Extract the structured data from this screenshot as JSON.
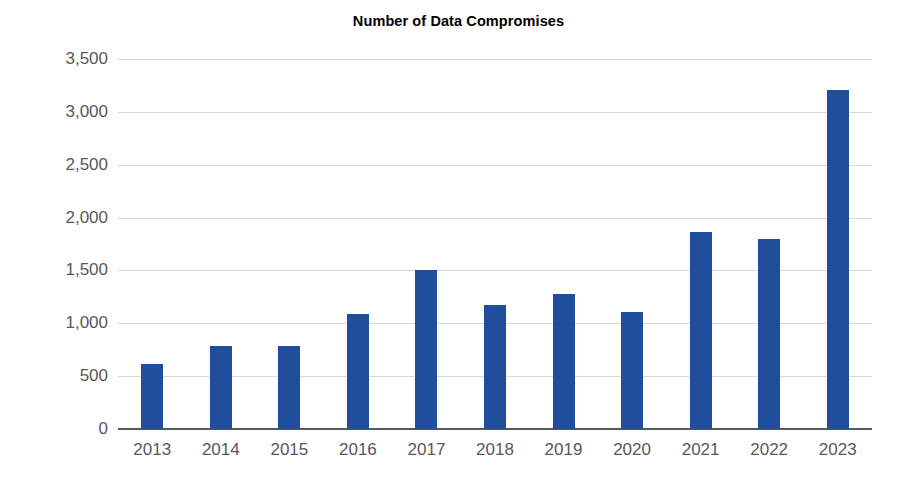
{
  "chart_data": {
    "type": "bar",
    "title": "Number of Data Compromises",
    "xlabel": "",
    "ylabel": "",
    "categories": [
      "2013",
      "2014",
      "2015",
      "2016",
      "2017",
      "2018",
      "2019",
      "2020",
      "2021",
      "2022",
      "2023"
    ],
    "values": [
      617,
      783,
      781,
      1091,
      1506,
      1175,
      1279,
      1108,
      1862,
      1802,
      3205
    ],
    "ylim": [
      0,
      3500
    ],
    "ytick_values": [
      0,
      500,
      1000,
      1500,
      2000,
      2500,
      3000,
      3500
    ],
    "ytick_labels": [
      "0",
      "500",
      "1,000",
      "1,500",
      "2,000",
      "2,500",
      "3,000",
      "3,500"
    ],
    "grid": true,
    "legend": false,
    "series": [
      {
        "name": "Number of Data Compromises",
        "values": [
          617,
          783,
          781,
          1091,
          1506,
          1175,
          1279,
          1108,
          1862,
          1802,
          3205
        ]
      }
    ],
    "colors": {
      "bar": "#1f4e9c",
      "gridline": "#d8d8d8",
      "axis": "#58585a",
      "tick_label": "#58585a",
      "title": "#000000",
      "background": "#ffffff"
    }
  }
}
